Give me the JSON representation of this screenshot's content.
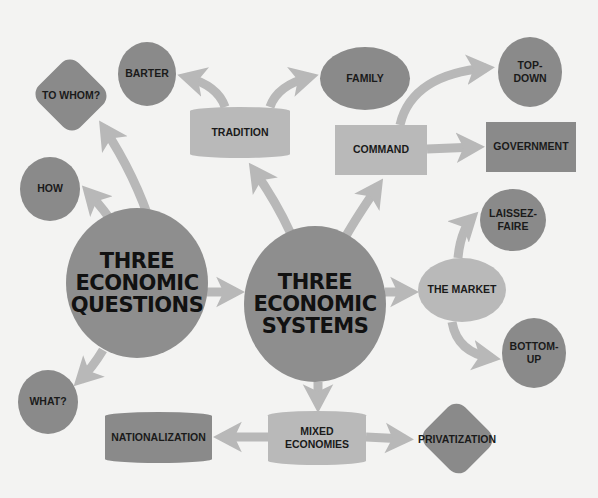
{
  "colors": {
    "background": "#f3f3f2",
    "dark_node": "#8a8a8a",
    "light_node": "#b9b9b9",
    "center_node": "#8e8e8e",
    "arrow": "#b8b8b8",
    "text": "#1a1a1a"
  },
  "center_nodes": {
    "questions": {
      "label": "THREE\nECONOMIC\nQUESTIONS"
    },
    "systems": {
      "label": "THREE\nECONOMIC\nSYSTEMS"
    }
  },
  "question_nodes": [
    {
      "id": "to-whom",
      "label": "TO WHOM?",
      "shape": "diamond"
    },
    {
      "id": "how",
      "label": "HOW",
      "shape": "circle"
    },
    {
      "id": "what",
      "label": "WHAT?",
      "shape": "circle"
    }
  ],
  "system_nodes": {
    "tradition": {
      "label": "TRADITION",
      "children": [
        {
          "id": "barter",
          "label": "BARTER",
          "shape": "circle"
        },
        {
          "id": "family",
          "label": "FAMILY",
          "shape": "ellipse"
        }
      ]
    },
    "command": {
      "label": "COMMAND",
      "children": [
        {
          "id": "top-down",
          "label": "TOP-\nDOWN",
          "shape": "circle"
        },
        {
          "id": "government",
          "label": "GOVERNMENT",
          "shape": "rectangle"
        }
      ]
    },
    "market": {
      "label": "THE MARKET",
      "children": [
        {
          "id": "laissez-faire",
          "label": "LAISSEZ-\nFAIRE",
          "shape": "circle"
        },
        {
          "id": "bottom-up",
          "label": "BOTTOM-\nUP",
          "shape": "circle"
        }
      ]
    },
    "mixed": {
      "label": "MIXED\nECONOMIES",
      "children": [
        {
          "id": "nationalization",
          "label": "NATIONALIZATION",
          "shape": "barrel"
        },
        {
          "id": "privatization",
          "label": "PRIVATIZATION",
          "shape": "diamond"
        }
      ]
    }
  },
  "edges": [
    [
      "THREE ECONOMIC QUESTIONS",
      "TO WHOM?"
    ],
    [
      "THREE ECONOMIC QUESTIONS",
      "HOW"
    ],
    [
      "THREE ECONOMIC QUESTIONS",
      "WHAT?"
    ],
    [
      "THREE ECONOMIC QUESTIONS",
      "THREE ECONOMIC SYSTEMS"
    ],
    [
      "THREE ECONOMIC SYSTEMS",
      "TRADITION"
    ],
    [
      "THREE ECONOMIC SYSTEMS",
      "COMMAND"
    ],
    [
      "THREE ECONOMIC SYSTEMS",
      "THE MARKET"
    ],
    [
      "THREE ECONOMIC SYSTEMS",
      "MIXED ECONOMIES"
    ],
    [
      "TRADITION",
      "BARTER"
    ],
    [
      "TRADITION",
      "FAMILY"
    ],
    [
      "COMMAND",
      "TOP-DOWN"
    ],
    [
      "COMMAND",
      "GOVERNMENT"
    ],
    [
      "THE MARKET",
      "LAISSEZ-FAIRE"
    ],
    [
      "THE MARKET",
      "BOTTOM-UP"
    ],
    [
      "MIXED ECONOMIES",
      "NATIONALIZATION"
    ],
    [
      "MIXED ECONOMIES",
      "PRIVATIZATION"
    ]
  ]
}
